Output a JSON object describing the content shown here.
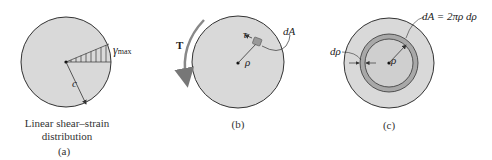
{
  "panel_a": {
    "label_gamma": "γ",
    "label_gamma_sub": "max",
    "label_radius": "c",
    "caption_line1": "Linear shear–strain",
    "caption_line2": "distribution",
    "panel_tag": "(a)"
  },
  "panel_b": {
    "label_torque": "T",
    "label_tau": "τ",
    "label_rho": "ρ",
    "label_dA": "dA",
    "panel_tag": "(b)"
  },
  "panel_c": {
    "label_drho": "dρ",
    "label_rho": "ρ",
    "label_dA_eq": "dA = 2πρ dρ",
    "panel_tag": "(c)"
  },
  "colors": {
    "disk_fill": "#d9d9d9",
    "ring_fill": "#a8a8a8",
    "outline": "#333333"
  }
}
